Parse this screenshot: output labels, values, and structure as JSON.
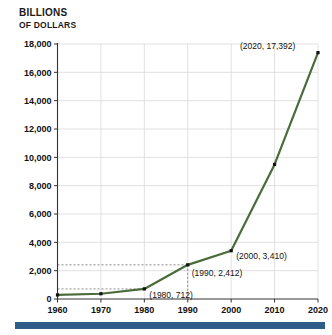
{
  "chart_data": {
    "type": "line",
    "title": "BILLIONS OF DOLLARS",
    "title_line1": "BILLIONS",
    "title_line2": "OF DOLLARS",
    "xlabel": "",
    "ylabel": "Billions of dollars",
    "x": [
      1960,
      1970,
      1980,
      1990,
      2000,
      2010,
      2020
    ],
    "values": [
      286,
      371,
      712,
      2412,
      3410,
      9500,
      17392
    ],
    "xlim": [
      1960,
      2020
    ],
    "ylim": [
      0,
      18000
    ],
    "xticks": [
      "1960",
      "1970",
      "1980",
      "1990",
      "2000",
      "2010",
      "2020"
    ],
    "yticks": [
      "0",
      "2,000",
      "4,000",
      "6,000",
      "8,000",
      "10,000",
      "12,000",
      "14,000",
      "16,000",
      "18,000"
    ],
    "grid": true,
    "legend": "none",
    "line_color": "#4a6b3a",
    "marker_color": "#111111",
    "grid_color": "#d9d9d9",
    "accent_bar_color": "#2f5d8a",
    "annotations": [
      {
        "label": "(1980, 712)",
        "x": 1980,
        "y": 712
      },
      {
        "label": "(1990, 2,412)",
        "x": 1990,
        "y": 2412
      },
      {
        "label": "(2000, 3,410)",
        "x": 2000,
        "y": 3410
      },
      {
        "label": "(2020, 17,392)",
        "x": 2020,
        "y": 17392
      }
    ],
    "guide_lines": [
      {
        "type": "horizontal",
        "y": 2412
      },
      {
        "type": "horizontal",
        "y": 712
      },
      {
        "type": "vertical",
        "x": 1990
      }
    ]
  }
}
